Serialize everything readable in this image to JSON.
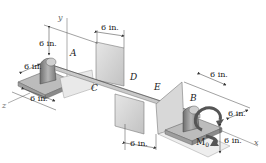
{
  "diagram": {
    "type": "statics-shaft-bearing-figure",
    "axes": {
      "x": "x",
      "y": "y",
      "z": "z"
    },
    "points": {
      "A": "A",
      "B": "B",
      "C": "C",
      "D": "D",
      "E": "E"
    },
    "moment": {
      "symbol": "M",
      "subscript": "0"
    },
    "dimensions": {
      "a_vertical": "6 in.",
      "a_depth": "6 in.",
      "a_base": "6 in.",
      "plate_c_top": "6 in.",
      "plate_d_bottom": "6 in.",
      "b_top": "6 in.",
      "b_right_upper": "6 in.",
      "b_right_lower": "6 in."
    },
    "colors": {
      "plate": "#d4d4d4",
      "plate_edge": "#8a8a8a",
      "bearing": "#9a9a9a",
      "shaft": "#bdbdbd",
      "line": "#333333",
      "arrow": "#555555"
    }
  }
}
